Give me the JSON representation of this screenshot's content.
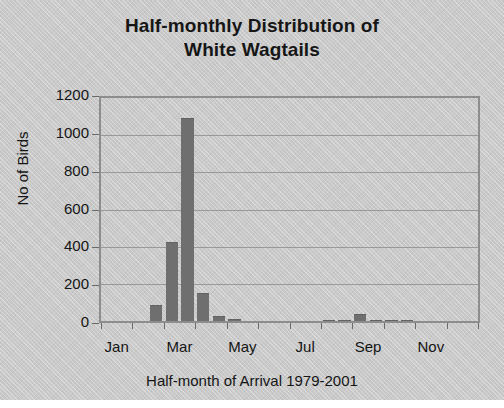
{
  "chart_data": {
    "type": "bar",
    "title": "Half-monthly Distribution of White Wagtails",
    "title_lines": [
      "Half-monthly Distribution of",
      "White Wagtails"
    ],
    "xlabel": "Half-month of Arrival 1979-2001",
    "ylabel": "No of Birds",
    "ylim": [
      0,
      1200
    ],
    "ytick_labels": [
      "1200",
      "1000",
      "800",
      "600",
      "400",
      "200",
      "0"
    ],
    "ytick_values": [
      1200,
      1000,
      800,
      600,
      400,
      200,
      0
    ],
    "xtick_labels": [
      "Jan",
      "Mar",
      "May",
      "Jul",
      "Sep",
      "Nov"
    ],
    "xtick_bin_index": [
      0,
      4,
      8,
      12,
      16,
      20
    ],
    "grid": "horizontal",
    "legend": "none",
    "bar_color": "#6f6f6f",
    "plot_background": "#c9c9c9",
    "categories": [
      "Jan 1st half",
      "Jan 2nd half",
      "Feb 1st half",
      "Feb 2nd half",
      "Mar 1st half",
      "Mar 2nd half",
      "Apr 1st half",
      "Apr 2nd half",
      "May 1st half",
      "May 2nd half",
      "Jun 1st half",
      "Jun 2nd half",
      "Jul 1st half",
      "Jul 2nd half",
      "Aug 1st half",
      "Aug 2nd half",
      "Sep 1st half",
      "Sep 2nd half",
      "Oct 1st half",
      "Oct 2nd half",
      "Nov 1st half",
      "Nov 2nd half",
      "Dec 1st half",
      "Dec 2nd half"
    ],
    "values": [
      0,
      0,
      0,
      85,
      425,
      1090,
      153,
      25,
      12,
      0,
      0,
      0,
      0,
      0,
      8,
      8,
      40,
      8,
      4,
      4,
      0,
      0,
      0,
      0
    ]
  }
}
